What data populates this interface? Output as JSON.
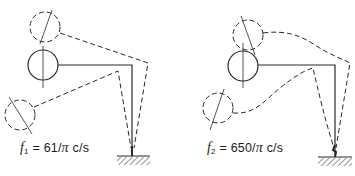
{
  "diagrams": [
    {
      "id": "mode-1",
      "symbol": "f",
      "subscript": "1",
      "equals": "=",
      "value": "61/",
      "pi": "π",
      "unit": "c/s"
    },
    {
      "id": "mode-2",
      "symbol": "f",
      "subscript": "2",
      "equals": "=",
      "value": "650/",
      "pi": "π",
      "unit": "c/s"
    }
  ],
  "colors": {
    "line": "#2a2a2a",
    "background": "#ffffff"
  }
}
